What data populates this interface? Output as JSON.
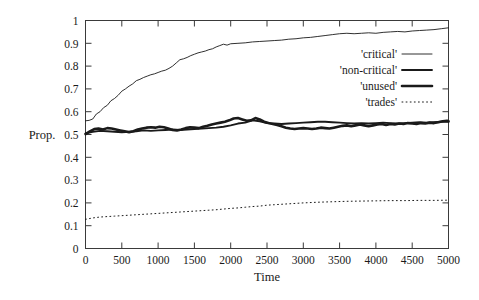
{
  "chart_data": {
    "type": "line",
    "title": "",
    "xlabel": "Time",
    "ylabel": "Prop.",
    "xlim": [
      0,
      5000
    ],
    "ylim": [
      0,
      1
    ],
    "grid": false,
    "legend_position": "upper-right-inside",
    "xticks": [
      "0",
      "500",
      "1000",
      "1500",
      "2000",
      "2500",
      "3000",
      "3500",
      "4000",
      "4500",
      "5000"
    ],
    "xtick_values": [
      0,
      500,
      1000,
      1500,
      2000,
      2500,
      3000,
      3500,
      4000,
      4500,
      5000
    ],
    "yticks": [
      "0",
      "0.1",
      "0.2",
      "0.3",
      "0.4",
      "0.5",
      "0.6",
      "0.7",
      "0.8",
      "0.9",
      "1"
    ],
    "ytick_values": [
      0,
      0.1,
      0.2,
      0.3,
      0.4,
      0.5,
      0.6,
      0.7,
      0.8,
      0.9,
      1
    ],
    "series": [
      {
        "name": "'critical'",
        "style": "thin-solid",
        "stroke_width": 0.9,
        "x": [
          0,
          50,
          100,
          150,
          200,
          250,
          300,
          350,
          400,
          450,
          500,
          550,
          600,
          650,
          700,
          750,
          800,
          850,
          900,
          950,
          1000,
          1050,
          1100,
          1150,
          1200,
          1250,
          1300,
          1350,
          1400,
          1450,
          1500,
          1550,
          1600,
          1650,
          1700,
          1750,
          1800,
          1850,
          1900,
          1950,
          2000,
          2100,
          2200,
          2300,
          2400,
          2500,
          2600,
          2700,
          2800,
          2900,
          3000,
          3100,
          3200,
          3300,
          3400,
          3500,
          3600,
          3700,
          3800,
          3900,
          4000,
          4100,
          4200,
          4300,
          4400,
          4500,
          4600,
          4700,
          4800,
          4900,
          5000
        ],
        "y": [
          0.56,
          0.562,
          0.568,
          0.59,
          0.6,
          0.618,
          0.628,
          0.648,
          0.658,
          0.672,
          0.69,
          0.7,
          0.712,
          0.722,
          0.736,
          0.742,
          0.75,
          0.756,
          0.762,
          0.766,
          0.772,
          0.778,
          0.782,
          0.79,
          0.8,
          0.814,
          0.828,
          0.832,
          0.838,
          0.846,
          0.852,
          0.858,
          0.862,
          0.866,
          0.872,
          0.876,
          0.884,
          0.89,
          0.896,
          0.892,
          0.898,
          0.9,
          0.902,
          0.906,
          0.908,
          0.91,
          0.912,
          0.914,
          0.918,
          0.92,
          0.924,
          0.926,
          0.93,
          0.934,
          0.938,
          0.942,
          0.944,
          0.942,
          0.944,
          0.946,
          0.944,
          0.948,
          0.95,
          0.952,
          0.95,
          0.954,
          0.956,
          0.958,
          0.96,
          0.964,
          0.968
        ]
      },
      {
        "name": "'non-critical'",
        "style": "medium-solid",
        "stroke_width": 1.9,
        "x": [
          0,
          100,
          200,
          300,
          400,
          500,
          600,
          700,
          800,
          900,
          1000,
          1100,
          1200,
          1300,
          1400,
          1500,
          1600,
          1700,
          1800,
          1900,
          2000,
          2100,
          2200,
          2300,
          2400,
          2500,
          2600,
          2700,
          2800,
          2900,
          3000,
          3100,
          3200,
          3300,
          3400,
          3500,
          3600,
          3700,
          3800,
          3900,
          4000,
          4100,
          4200,
          4300,
          4400,
          4500,
          4600,
          4700,
          4800,
          4900,
          5000
        ],
        "y": [
          0.505,
          0.512,
          0.516,
          0.514,
          0.512,
          0.51,
          0.512,
          0.514,
          0.518,
          0.516,
          0.518,
          0.52,
          0.522,
          0.52,
          0.522,
          0.524,
          0.526,
          0.528,
          0.53,
          0.534,
          0.54,
          0.548,
          0.552,
          0.562,
          0.558,
          0.55,
          0.548,
          0.546,
          0.548,
          0.55,
          0.552,
          0.554,
          0.556,
          0.556,
          0.554,
          0.552,
          0.55,
          0.548,
          0.55,
          0.548,
          0.55,
          0.552,
          0.55,
          0.548,
          0.55,
          0.552,
          0.554,
          0.552,
          0.554,
          0.556,
          0.556
        ]
      },
      {
        "name": "'unused'",
        "style": "bold-solid",
        "stroke_width": 2.6,
        "x": [
          0,
          60,
          120,
          180,
          240,
          300,
          360,
          420,
          480,
          540,
          600,
          660,
          720,
          780,
          840,
          900,
          960,
          1020,
          1080,
          1140,
          1200,
          1260,
          1320,
          1380,
          1440,
          1500,
          1560,
          1620,
          1680,
          1740,
          1800,
          1860,
          1920,
          1980,
          2040,
          2100,
          2160,
          2220,
          2280,
          2340,
          2400,
          2460,
          2520,
          2580,
          2640,
          2700,
          2760,
          2820,
          2880,
          2940,
          3000,
          3060,
          3120,
          3180,
          3240,
          3300,
          3360,
          3420,
          3480,
          3540,
          3600,
          3660,
          3720,
          3780,
          3840,
          3900,
          3960,
          4020,
          4080,
          4140,
          4200,
          4260,
          4320,
          4380,
          4440,
          4500,
          4560,
          4620,
          4680,
          4740,
          4800,
          4860,
          4920,
          4980,
          5000
        ],
        "y": [
          0.502,
          0.514,
          0.524,
          0.526,
          0.522,
          0.528,
          0.526,
          0.522,
          0.518,
          0.514,
          0.51,
          0.514,
          0.522,
          0.526,
          0.53,
          0.532,
          0.53,
          0.534,
          0.532,
          0.526,
          0.52,
          0.518,
          0.522,
          0.528,
          0.532,
          0.53,
          0.528,
          0.534,
          0.538,
          0.544,
          0.548,
          0.552,
          0.556,
          0.562,
          0.57,
          0.572,
          0.566,
          0.56,
          0.562,
          0.572,
          0.566,
          0.556,
          0.55,
          0.546,
          0.542,
          0.536,
          0.53,
          0.526,
          0.524,
          0.526,
          0.528,
          0.526,
          0.524,
          0.526,
          0.53,
          0.528,
          0.526,
          0.53,
          0.534,
          0.538,
          0.54,
          0.536,
          0.54,
          0.544,
          0.54,
          0.536,
          0.54,
          0.544,
          0.546,
          0.542,
          0.546,
          0.544,
          0.548,
          0.546,
          0.55,
          0.548,
          0.546,
          0.55,
          0.548,
          0.552,
          0.55,
          0.554,
          0.558,
          0.56,
          0.558
        ]
      },
      {
        "name": "'trades'",
        "style": "dotted",
        "stroke_width": 1.0,
        "x": [
          0,
          100,
          200,
          300,
          400,
          500,
          600,
          700,
          800,
          900,
          1000,
          1100,
          1200,
          1300,
          1400,
          1500,
          1600,
          1700,
          1800,
          1900,
          2000,
          2100,
          2200,
          2300,
          2400,
          2500,
          2600,
          2700,
          2800,
          2900,
          3000,
          3200,
          3400,
          3600,
          3800,
          4000,
          4200,
          4400,
          4600,
          4800,
          5000
        ],
        "y": [
          0.128,
          0.134,
          0.138,
          0.14,
          0.142,
          0.144,
          0.146,
          0.148,
          0.15,
          0.152,
          0.154,
          0.156,
          0.158,
          0.16,
          0.162,
          0.164,
          0.166,
          0.168,
          0.17,
          0.173,
          0.176,
          0.178,
          0.181,
          0.184,
          0.186,
          0.19,
          0.192,
          0.194,
          0.196,
          0.198,
          0.2,
          0.203,
          0.205,
          0.207,
          0.208,
          0.209,
          0.21,
          0.21,
          0.211,
          0.211,
          0.212
        ]
      }
    ]
  },
  "legend": {
    "entries": [
      {
        "label": "'critical'",
        "style": "thin-solid"
      },
      {
        "label": "'non-critical'",
        "style": "medium-solid"
      },
      {
        "label": "'unused'",
        "style": "bold-solid"
      },
      {
        "label": "'trades'",
        "style": "dotted"
      }
    ]
  }
}
